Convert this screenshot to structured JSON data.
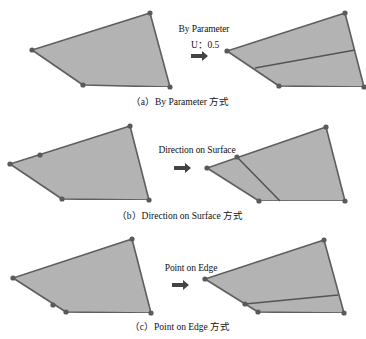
{
  "figure": {
    "fill_color": "#b3b3b3",
    "edge_color": "#555555",
    "vertex_color": "#5a5a5a",
    "arrow_color": "#444444",
    "panels": [
      {
        "id": "a",
        "operation_label": "By Parameter",
        "parameter_label": "U：0.5",
        "caption": "（a）By Parameter 方式",
        "before": {
          "polygon": [
            [
              32,
              50
            ],
            [
              150,
              13
            ],
            [
              170,
              87
            ],
            [
              83,
              85
            ]
          ],
          "vertices": [
            [
              32,
              50
            ],
            [
              150,
              13
            ],
            [
              170,
              87
            ],
            [
              83,
              85
            ]
          ]
        },
        "after": {
          "polygon": [
            [
              227,
              51
            ],
            [
              345,
              13
            ],
            [
              364,
              87
            ],
            [
              279,
              86
            ]
          ],
          "vertices": [
            [
              227,
              51
            ],
            [
              345,
              13
            ],
            [
              364,
              87
            ],
            [
              279,
              86
            ]
          ],
          "split_line": [
            [
              255,
              68
            ],
            [
              355,
              50
            ]
          ]
        }
      },
      {
        "id": "b",
        "operation_label": "Direction on Surface",
        "caption": "（b）Direction on Surface 方式",
        "before": {
          "polygon": [
            [
              10,
              164
            ],
            [
              130,
              126
            ],
            [
              149,
              200
            ],
            [
              62,
              199
            ]
          ],
          "vertices": [
            [
              10,
              164
            ],
            [
              40,
              155
            ],
            [
              130,
              126
            ],
            [
              149,
              200
            ],
            [
              62,
              199
            ]
          ]
        },
        "after": {
          "polygon": [
            [
              207,
              168
            ],
            [
              326,
              127
            ],
            [
              345,
              201
            ],
            [
              259,
              201
            ]
          ],
          "vertices": [
            [
              207,
              168
            ],
            [
              237,
              157
            ],
            [
              326,
              127
            ],
            [
              345,
              201
            ],
            [
              259,
              201
            ]
          ],
          "split_line": [
            [
              237,
              157
            ],
            [
              280,
              201
            ]
          ]
        }
      },
      {
        "id": "c",
        "operation_label": "Point on Edge",
        "caption": "（c）Point on Edge 方式",
        "before": {
          "polygon": [
            [
              13,
              278
            ],
            [
              132,
              239
            ],
            [
              151,
              313
            ],
            [
              66,
              312
            ]
          ],
          "vertices": [
            [
              13,
              278
            ],
            [
              132,
              239
            ],
            [
              151,
              313
            ],
            [
              66,
              312
            ],
            [
              53,
              305
            ]
          ]
        },
        "after": {
          "polygon": [
            [
              205,
              279
            ],
            [
              324,
              240
            ],
            [
              344,
              313
            ],
            [
              258,
              312
            ]
          ],
          "vertices": [
            [
              205,
              279
            ],
            [
              324,
              240
            ],
            [
              344,
              313
            ],
            [
              258,
              312
            ],
            [
              245,
              304
            ]
          ],
          "split_line": [
            [
              245,
              304
            ],
            [
              338,
              295
            ]
          ]
        }
      }
    ]
  }
}
